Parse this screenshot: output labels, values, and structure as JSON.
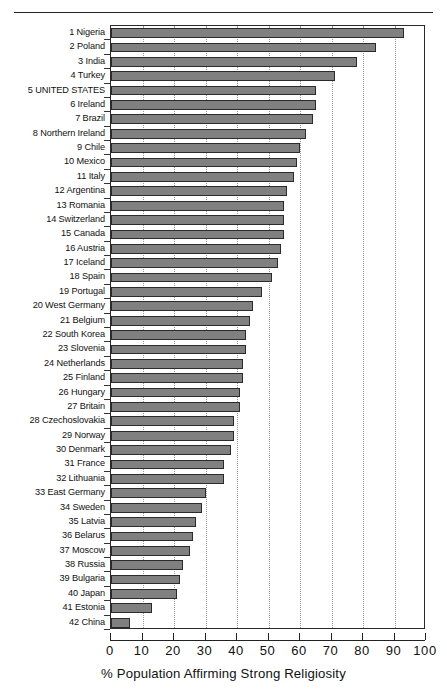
{
  "figure": {
    "top_caption": "",
    "xaxis_title": "% Population Affirming Strong Religiosity"
  },
  "axis": {
    "ticks": [
      "0",
      "10",
      "20",
      "30",
      "40",
      "50",
      "60",
      "70",
      "80",
      "90",
      "100"
    ]
  },
  "colors": {
    "bar_fill": "#808080",
    "bar_stroke": "#2b2b2b",
    "gridline": "#9a9a9a",
    "frame": "#2a2a2a",
    "text": "#111111",
    "background": "#ffffff"
  },
  "chart_data": {
    "type": "bar",
    "orientation": "horizontal",
    "title": "",
    "subtitle": "",
    "xlabel": "% Population Affirming Strong Religiosity",
    "ylabel": "",
    "xlim": [
      0,
      100
    ],
    "xticks": [
      0,
      10,
      20,
      30,
      40,
      50,
      60,
      70,
      80,
      90,
      100
    ],
    "grid": "vertical-dotted",
    "legend": "none",
    "categories": [
      "1 Nigeria",
      "2 Poland",
      "3 India",
      "4 Turkey",
      "5 UNITED STATES",
      "6 Ireland",
      "7 Brazil",
      "8 Northern Ireland",
      "9 Chile",
      "10 Mexico",
      "11 Italy",
      "12 Argentina",
      "13 Romania",
      "14 Switzerland",
      "15 Canada",
      "16 Austria",
      "17 Iceland",
      "18 Spain",
      "19 Portugal",
      "20 West Germany",
      "21 Belgium",
      "22 South Korea",
      "23 Slovenia",
      "24 Netherlands",
      "25 Finland",
      "26 Hungary",
      "27 Britain",
      "28 Czechoslovakia",
      "29 Norway",
      "30 Denmark",
      "31 France",
      "32 Lithuania",
      "33 East Germany",
      "34 Sweden",
      "35 Latvia",
      "36 Belarus",
      "37 Moscow",
      "38 Russia",
      "39 Bulgaria",
      "40 Japan",
      "41 Estonia",
      "42 China"
    ],
    "values": [
      93,
      84,
      78,
      71,
      65,
      65,
      64,
      62,
      60,
      59,
      58,
      56,
      55,
      55,
      55,
      54,
      53,
      51,
      48,
      45,
      44,
      43,
      43,
      42,
      42,
      41,
      41,
      39,
      39,
      38,
      36,
      36,
      30,
      29,
      27,
      26,
      25,
      23,
      22,
      21,
      13,
      6
    ]
  }
}
